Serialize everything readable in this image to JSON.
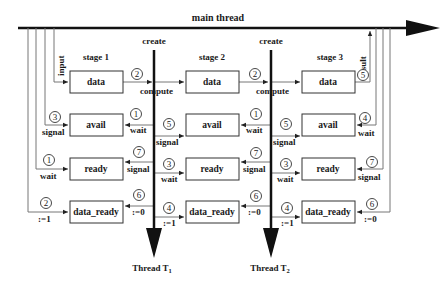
{
  "main_thread": {
    "label": "main thread"
  },
  "threads": [
    {
      "create_label": "create",
      "name": "Thread T",
      "sub": "1"
    },
    {
      "create_label": "create",
      "name": "Thread T",
      "sub": "2"
    }
  ],
  "stages": [
    {
      "label": "stage 1",
      "boxes": [
        "data",
        "avail",
        "ready",
        "data_ready"
      ]
    },
    {
      "label": "stage 2",
      "boxes": [
        "data",
        "avail",
        "ready",
        "data_ready"
      ]
    },
    {
      "label": "stage 3",
      "boxes": [
        "data",
        "avail",
        "ready",
        "data_ready"
      ]
    }
  ],
  "left_edges": {
    "input": "input",
    "avail": {
      "num": "3",
      "text": "signal"
    },
    "ready": {
      "num": "1",
      "text": "wait"
    },
    "data_ready": {
      "num": "2",
      "text": ":=1"
    }
  },
  "t1_edges": {
    "data": {
      "num": "2",
      "text": "compute"
    },
    "avail_back": {
      "num": "1",
      "text": "wait"
    },
    "avail_fwd": {
      "num": "5",
      "text": "signal"
    },
    "ready_back": {
      "num": "7",
      "text": "signal"
    },
    "ready_fwd": {
      "num": "3",
      "text": "wait"
    },
    "data_ready_back": {
      "num": "6",
      "text": ":=0"
    },
    "data_ready_fwd": {
      "num": "4",
      "text": ":=1"
    }
  },
  "t2_edges": {
    "data": {
      "num": "2",
      "text": "compute"
    },
    "avail_back": {
      "num": "1",
      "text": "wait"
    },
    "avail_fwd": {
      "num": "5",
      "text": "signal"
    },
    "ready_back": {
      "num": "7",
      "text": "signal"
    },
    "ready_fwd": {
      "num": "3",
      "text": "wait"
    },
    "data_ready_back": {
      "num": "6",
      "text": ":=0"
    },
    "data_ready_fwd": {
      "num": "4",
      "text": ":=1"
    }
  },
  "right_edges": {
    "result": {
      "num": "5",
      "text": "result"
    },
    "avail": {
      "num": "4",
      "text": "wait"
    },
    "ready": {
      "num": "7",
      "text": "signal"
    },
    "data_ready": {
      "num": "6",
      "text": ":=0"
    }
  }
}
